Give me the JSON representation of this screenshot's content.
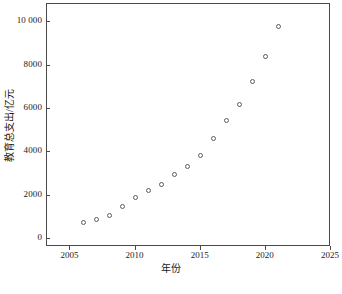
{
  "chart_data": {
    "type": "scatter",
    "title": "",
    "xlabel": "年份",
    "ylabel": "教育总支出/亿元",
    "xlim": [
      2003.2,
      2025.0
    ],
    "ylim": [
      -360,
      10840
    ],
    "xticks": [
      2005,
      2010,
      2015,
      2020,
      2025
    ],
    "xtick_labels": [
      "2005",
      "2010",
      "2015",
      "2020",
      "2025"
    ],
    "yticks": [
      0,
      2000,
      4000,
      6000,
      8000,
      10000
    ],
    "ytick_labels": [
      "0",
      "2000",
      "4000",
      "6000",
      "8000",
      "10 000"
    ],
    "grid": false,
    "legend": null,
    "marker": "open-circle",
    "marker_color": "#5b5b63",
    "x": [
      2006,
      2007,
      2008,
      2009,
      2010,
      2011,
      2012,
      2013,
      2014,
      2015,
      2016,
      2017,
      2018,
      2019,
      2020,
      2021
    ],
    "values": [
      780,
      890,
      1110,
      1500,
      1910,
      2260,
      2540,
      2960,
      3350,
      3860,
      4640,
      5480,
      6220,
      7250,
      8420,
      9800
    ],
    "points": [
      {
        "year": 2006,
        "value": 780
      },
      {
        "year": 2007,
        "value": 890
      },
      {
        "year": 2008,
        "value": 1110
      },
      {
        "year": 2009,
        "value": 1500
      },
      {
        "year": 2010,
        "value": 1910
      },
      {
        "year": 2011,
        "value": 2260
      },
      {
        "year": 2012,
        "value": 2540
      },
      {
        "year": 2013,
        "value": 2960
      },
      {
        "year": 2014,
        "value": 3350
      },
      {
        "year": 2015,
        "value": 3860
      },
      {
        "year": 2016,
        "value": 4640
      },
      {
        "year": 2017,
        "value": 5480
      },
      {
        "year": 2018,
        "value": 6220
      },
      {
        "year": 2019,
        "value": 7250
      },
      {
        "year": 2020,
        "value": 8420
      },
      {
        "year": 2021,
        "value": 9800
      }
    ]
  },
  "axes": {
    "x_title": "年份",
    "y_title": "教育总支出/亿元",
    "x_tick_labels": [
      "2005",
      "2010",
      "2015",
      "2020",
      "2025"
    ],
    "y_tick_labels": [
      "0",
      "2000",
      "4000",
      "6000",
      "8000",
      "10 000"
    ]
  },
  "colors": {
    "frame": "#4a4a4a",
    "marker": "#5b5b63",
    "text": "#1a1a1a",
    "background": "#ffffff"
  }
}
